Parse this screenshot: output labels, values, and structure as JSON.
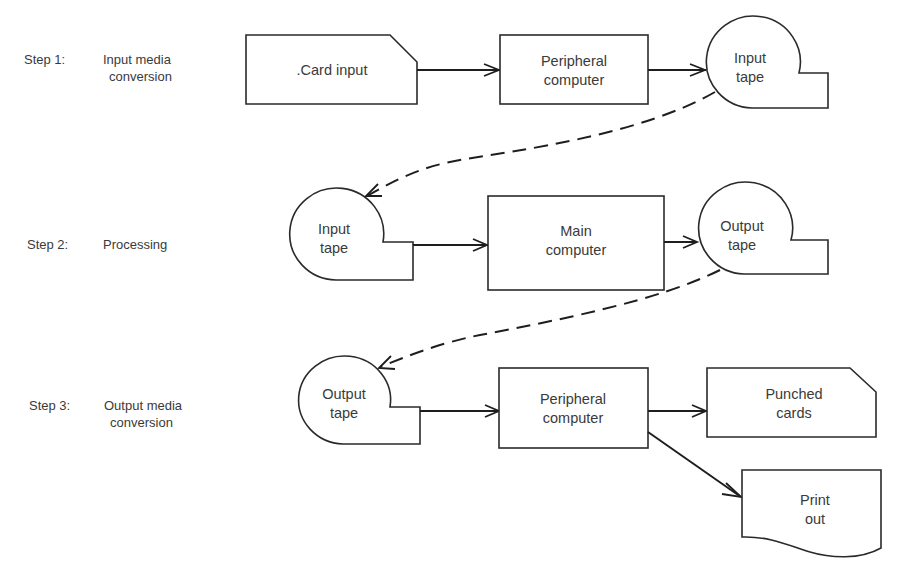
{
  "diagram": {
    "type": "flowchart",
    "colors": {
      "stroke": "#2a2a2a",
      "text": "#3a3a3a",
      "background": "#ffffff"
    },
    "steps": [
      {
        "id": "step1",
        "number": "Step 1:",
        "title_line1": "Input media",
        "title_line2": "conversion"
      },
      {
        "id": "step2",
        "number": "Step 2:",
        "title_line1": "Processing",
        "title_line2": ""
      },
      {
        "id": "step3",
        "number": "Step 3:",
        "title_line1": "Output media",
        "title_line2": "conversion"
      }
    ],
    "nodes": {
      "card_input": {
        "shape": "punched-card",
        "line1": ".Card input",
        "line2": ""
      },
      "peripheral_computer_1": {
        "shape": "process",
        "line1": "Peripheral",
        "line2": "computer"
      },
      "input_tape_1": {
        "shape": "magnetic-tape",
        "line1": "Input",
        "line2": "tape"
      },
      "input_tape_2": {
        "shape": "magnetic-tape",
        "line1": "Input",
        "line2": "tape"
      },
      "main_computer": {
        "shape": "process",
        "line1": "Main",
        "line2": "computer"
      },
      "output_tape_1": {
        "shape": "magnetic-tape",
        "line1": "Output",
        "line2": "tape"
      },
      "output_tape_2": {
        "shape": "magnetic-tape",
        "line1": "Output",
        "line2": "tape"
      },
      "peripheral_computer_2": {
        "shape": "process",
        "line1": "Peripheral",
        "line2": "computer"
      },
      "punched_cards": {
        "shape": "punched-card",
        "line1": "Punched",
        "line2": "cards"
      },
      "print_out": {
        "shape": "document",
        "line1": "Print",
        "line2": "out"
      }
    },
    "edges": [
      {
        "from": "card_input",
        "to": "peripheral_computer_1",
        "style": "solid"
      },
      {
        "from": "peripheral_computer_1",
        "to": "input_tape_1",
        "style": "solid"
      },
      {
        "from": "input_tape_1",
        "to": "input_tape_2",
        "style": "dashed"
      },
      {
        "from": "input_tape_2",
        "to": "main_computer",
        "style": "solid"
      },
      {
        "from": "main_computer",
        "to": "output_tape_1",
        "style": "solid"
      },
      {
        "from": "output_tape_1",
        "to": "output_tape_2",
        "style": "dashed"
      },
      {
        "from": "output_tape_2",
        "to": "peripheral_computer_2",
        "style": "solid"
      },
      {
        "from": "peripheral_computer_2",
        "to": "punched_cards",
        "style": "solid"
      },
      {
        "from": "peripheral_computer_2",
        "to": "print_out",
        "style": "solid"
      }
    ]
  }
}
